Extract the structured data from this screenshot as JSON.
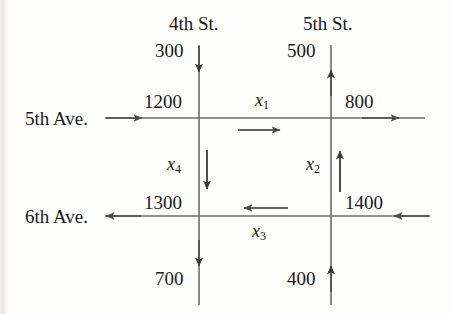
{
  "figure": {
    "type": "traffic-flow-network-diagram",
    "background_color": "#fdfdfb",
    "line_color": "#5a5a5a",
    "text_color": "#1a1a1a"
  },
  "streets": {
    "vertical": [
      {
        "id": "4th-st",
        "name": "4th St.",
        "x": 199
      },
      {
        "id": "5th-st",
        "name": "5th St.",
        "x": 331
      }
    ],
    "horizontal": [
      {
        "id": "5th-ave",
        "name": "5th Ave.",
        "y": 118
      },
      {
        "id": "6th-ave",
        "name": "6th Ave.",
        "y": 216
      }
    ]
  },
  "boundary_flows": [
    {
      "id": "in-4th-north",
      "value": "300",
      "direction": "down-into-network",
      "street": "4th St."
    },
    {
      "id": "in-5th-ave-west",
      "value": "1200",
      "direction": "right-into-network",
      "street": "5th Ave."
    },
    {
      "id": "out-5th-st-north",
      "value": "500",
      "direction": "up-out-of-network",
      "street": "5th St."
    },
    {
      "id": "out-5th-ave-east",
      "value": "800",
      "direction": "right-out-of-network",
      "street": "5th Ave."
    },
    {
      "id": "out-6th-ave-west",
      "value": "1300",
      "direction": "left-out-of-network",
      "street": "6th Ave."
    },
    {
      "id": "in-6th-ave-east",
      "value": "1400",
      "direction": "left-into-network",
      "street": "6th Ave."
    },
    {
      "id": "out-4th-south",
      "value": "700",
      "direction": "down-out-of-network",
      "street": "4th St."
    },
    {
      "id": "in-5th-st-south",
      "value": "400",
      "direction": "up-into-network",
      "street": "5th St."
    }
  ],
  "unknown_flows": [
    {
      "id": "x1",
      "label": "x",
      "subscript": "1",
      "segment": "5th Ave. between 4th St. and 5th St.",
      "direction": "right"
    },
    {
      "id": "x2",
      "label": "x",
      "subscript": "2",
      "segment": "5th St. between 6th Ave. and 5th Ave.",
      "direction": "up"
    },
    {
      "id": "x3",
      "label": "x",
      "subscript": "3",
      "segment": "6th Ave. between 5th St. and 4th St.",
      "direction": "left"
    },
    {
      "id": "x4",
      "label": "x",
      "subscript": "4",
      "segment": "4th St. between 5th Ave. and 6th Ave.",
      "direction": "down"
    }
  ],
  "labels": {
    "st_4th": "4th St.",
    "st_5th": "5th St.",
    "ave_5th": "5th Ave.",
    "ave_6th": "6th Ave.",
    "n300": "300",
    "n500": "500",
    "n1200": "1200",
    "n800": "800",
    "n1300": "1300",
    "n1400": "1400",
    "n700": "700",
    "n400": "400",
    "x_base": "x",
    "x1_sub": "1",
    "x2_sub": "2",
    "x3_sub": "3",
    "x4_sub": "4"
  }
}
